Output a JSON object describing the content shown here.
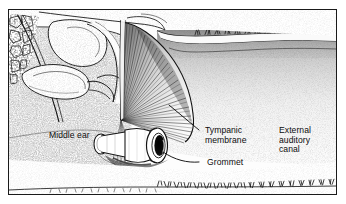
{
  "figure": {
    "kind": "anatomical-illustration",
    "style": "black-and-white stipple line drawing",
    "frame": {
      "border_color": "#1a1a1a",
      "background": "#fdfdfd"
    }
  },
  "labels": {
    "middle_ear": "Middle ear",
    "tympanic_membrane_line1": "Tympanic",
    "tympanic_membrane_line2": "membrane",
    "grommet": "Grommet",
    "external_canal_line1": "External",
    "external_canal_line2": "auditory",
    "external_canal_line3": "canal"
  },
  "colors": {
    "ink": "#0d0d0d",
    "line": "#1a1a1a",
    "stipple_dark": "#3a3a3a",
    "stipple_mid": "#8a8a8a",
    "stipple_light": "#c8c8c8",
    "paper": "#fdfdfd",
    "lumen_dark": "#101010"
  },
  "structures": [
    {
      "name": "ossicles",
      "label": "malleus and incus bones",
      "region": "upper-left"
    },
    {
      "name": "middle-ear-cavity",
      "label": "Middle ear",
      "region": "left"
    },
    {
      "name": "tympanic-membrane",
      "label": "Tympanic membrane",
      "region": "center, fan of radiating fibres"
    },
    {
      "name": "grommet",
      "label": "Grommet",
      "region": "center-low, flanged tube through membrane"
    },
    {
      "name": "external-auditory-canal",
      "label": "External auditory canal",
      "region": "right"
    },
    {
      "name": "canal-hair",
      "label": "cilia lining the canal wall",
      "region": "lower-right and upper-right"
    }
  ]
}
